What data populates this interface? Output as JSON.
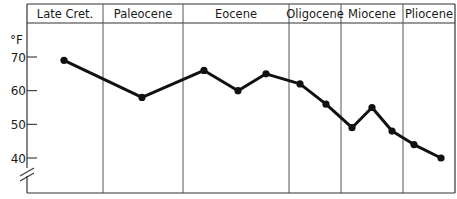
{
  "chart_data": {
    "type": "line",
    "title": "",
    "xlabel": "",
    "ylabel": "°F",
    "ylim": [
      35,
      73
    ],
    "yticks": [
      40,
      50,
      60,
      70
    ],
    "axis_break": true,
    "grid": false,
    "legend": null,
    "periods": [
      "Late Cret.",
      "Paleocene",
      "Eocene",
      "Oligocene",
      "Miocene",
      "Pliocene"
    ],
    "series": [
      {
        "name": "Temperature",
        "color": "#111111",
        "points": [
          {
            "period": "Late Cret.",
            "value": 69
          },
          {
            "period": "Paleocene",
            "value": 58
          },
          {
            "period": "Eocene",
            "value": 66
          },
          {
            "period": "Eocene",
            "value": 60
          },
          {
            "period": "Eocene",
            "value": 65
          },
          {
            "period": "Oligocene",
            "value": 62
          },
          {
            "period": "Oligocene",
            "value": 56
          },
          {
            "period": "Miocene",
            "value": 49
          },
          {
            "period": "Miocene",
            "value": 55
          },
          {
            "period": "Miocene",
            "value": 48
          },
          {
            "period": "Pliocene",
            "value": 44
          },
          {
            "period": "Pliocene",
            "value": 40
          }
        ]
      }
    ]
  },
  "layout": {
    "period_bounds_px": [
      27,
      103,
      183,
      289,
      341,
      403,
      455
    ],
    "point_x_px": [
      64,
      142,
      204,
      238,
      266,
      300,
      326,
      352,
      372,
      392,
      414,
      441
    ]
  }
}
